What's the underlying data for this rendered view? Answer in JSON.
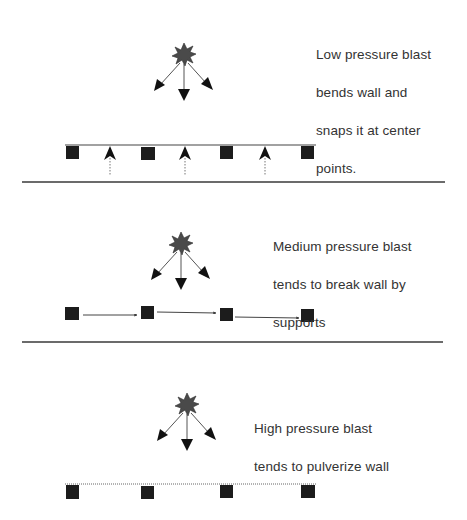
{
  "colors": {
    "background": "#ffffff",
    "text": "#333333",
    "support": "#1c1c1c",
    "blast": "#4a4a4a",
    "arrow": "#111111",
    "wall": "#555555",
    "divider": "#3a3a3a"
  },
  "panels": [
    {
      "id": "low",
      "caption_lines": [
        "Low pressure blast",
        "bends wall and",
        "snaps it at center",
        "points."
      ],
      "blast_icon": "explosion-star-icon",
      "wall_state": "solid-bent",
      "failure_arrows": "upward-at-midspans"
    },
    {
      "id": "medium",
      "caption_lines": [
        "Medium pressure blast",
        "tends to break wall by",
        "supports"
      ],
      "blast_icon": "explosion-star-icon",
      "wall_state": "broken-at-supports",
      "failure_arrows": "horizontal-between-supports"
    },
    {
      "id": "high",
      "caption_lines": [
        "High pressure blast",
        "tends to pulverize wall"
      ],
      "blast_icon": "explosion-star-icon",
      "wall_state": "pulverized-dotted",
      "failure_arrows": "none"
    }
  ]
}
